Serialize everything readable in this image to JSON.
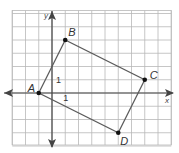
{
  "chart_data": {
    "type": "scatter",
    "title": "",
    "xlabel": "x",
    "ylabel": "y",
    "xlim": [
      -3,
      9
    ],
    "ylim": [
      -4,
      6
    ],
    "grid": true,
    "grid_step": 1,
    "polygon": {
      "name": "ABCD",
      "closed": true,
      "vertices": [
        {
          "label": "A",
          "x": -1,
          "y": 0
        },
        {
          "label": "B",
          "x": 1,
          "y": 4
        },
        {
          "label": "C",
          "x": 7,
          "y": 1
        },
        {
          "label": "D",
          "x": 5,
          "y": -3
        }
      ]
    },
    "annotations": [
      {
        "text": "1",
        "x": 0.5,
        "y": 1.2,
        "note": "unit label on y-axis"
      },
      {
        "text": "1",
        "x": 1,
        "y": -0.4,
        "note": "unit label on x-axis"
      }
    ]
  }
}
